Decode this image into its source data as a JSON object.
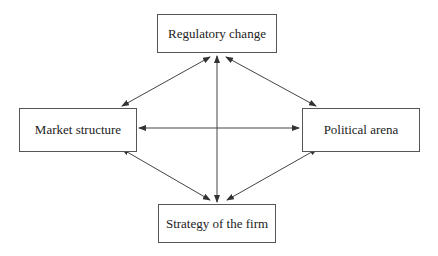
{
  "diagram": {
    "nodes": [
      {
        "id": "regulatory",
        "label": "Regulatory change"
      },
      {
        "id": "market",
        "label": "Market structure"
      },
      {
        "id": "political",
        "label": "Political arena"
      },
      {
        "id": "strategy",
        "label": "Strategy of the firm"
      }
    ],
    "edges": [
      {
        "from": "regulatory",
        "to": "market",
        "bidirectional": true
      },
      {
        "from": "regulatory",
        "to": "political",
        "bidirectional": true
      },
      {
        "from": "regulatory",
        "to": "strategy",
        "bidirectional": true
      },
      {
        "from": "market",
        "to": "political",
        "bidirectional": true
      },
      {
        "from": "market",
        "to": "strategy",
        "bidirectional": true
      },
      {
        "from": "political",
        "to": "strategy",
        "bidirectional": true
      }
    ],
    "colors": {
      "line": "#444444",
      "border": "#555555",
      "text": "#222222"
    }
  }
}
